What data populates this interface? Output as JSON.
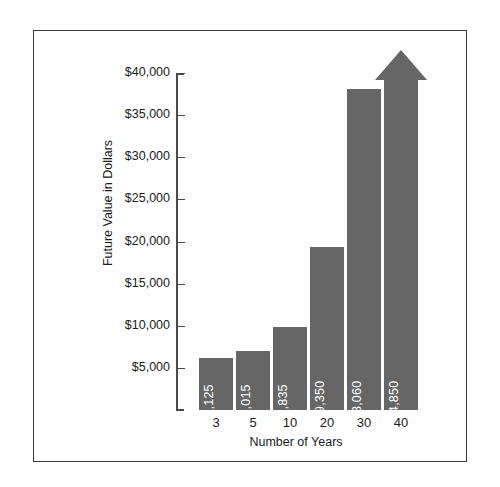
{
  "chart_data": {
    "type": "bar",
    "title": "",
    "xlabel": "Number of Years",
    "ylabel": "Future Value in Dollars",
    "categories": [
      "3",
      "5",
      "10",
      "20",
      "30",
      "40"
    ],
    "values": [
      6125,
      7015,
      9835,
      19350,
      38060,
      74850
    ],
    "bar_labels": [
      "$6,125",
      "$7,015",
      "$9,835",
      "$19,350",
      "$38,060",
      "$74,850"
    ],
    "y_ticks": [
      5000,
      10000,
      15000,
      20000,
      25000,
      30000,
      35000,
      40000
    ],
    "y_tick_labels": [
      "$5,000",
      "$10,000",
      "$15,000",
      "$20,000",
      "$25,000",
      "$30,000",
      "$35,000",
      "$40,000"
    ],
    "ylim": [
      0,
      40000
    ],
    "grid": false,
    "legend": "none",
    "bar_color": "#666666",
    "bar_label_color": "#ffffff",
    "axis_color": "#4a4a4a",
    "frame_color": "#3a3a3a",
    "background": "#ffffff"
  }
}
